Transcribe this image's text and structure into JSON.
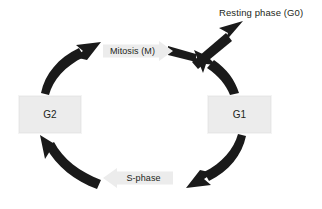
{
  "diagram": {
    "background_color": "#ffffff",
    "node_fill_color": "#ececec",
    "arrow_color": "#1a1a1a",
    "text_color": "#231f20",
    "nodes": [
      {
        "id": "g2",
        "label": "G2",
        "shape": "rectangle"
      },
      {
        "id": "g1",
        "label": "G1",
        "shape": "rectangle"
      },
      {
        "id": "mitosis",
        "label": "Mitosis (M)",
        "shape": "arrow-right"
      },
      {
        "id": "sphase",
        "label": "S-phase",
        "shape": "arrow-left"
      },
      {
        "id": "resting",
        "label": "Resting phase (G0)",
        "shape": "text"
      }
    ],
    "edges": [
      {
        "id": "g1-to-mitosis",
        "from": "G1",
        "to": "Mitosis (M)"
      },
      {
        "id": "mitosis-to-g0",
        "from": "Mitosis (M)",
        "to": "Resting phase (G0)"
      },
      {
        "id": "g1-to-sphase",
        "from": "G1",
        "to": "S-phase"
      },
      {
        "id": "sphase-to-g2",
        "from": "S-phase",
        "to": "G2"
      },
      {
        "id": "g2-to-mitosis",
        "from": "G2",
        "to": "Mitosis (M)"
      }
    ]
  }
}
